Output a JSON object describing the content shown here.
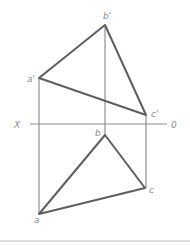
{
  "diagram": {
    "type": "orthographic-projection",
    "axis": {
      "left_label": "X",
      "right_label": "0",
      "y": 124,
      "x1": 30,
      "x2": 167
    },
    "colors": {
      "triangle": "#5e5e5e",
      "projector": "#7a7a7a",
      "axis": "#8a8a8a",
      "label": "#8a8a8a",
      "rule": "#bdbdbd"
    },
    "points": {
      "a_prime": {
        "label": "a'",
        "x": 39,
        "y": 78
      },
      "b_prime": {
        "label": "b'",
        "x": 105,
        "y": 25
      },
      "c_prime": {
        "label": "c'",
        "x": 146,
        "y": 115
      },
      "a": {
        "label": "a",
        "x": 39,
        "y": 214
      },
      "b": {
        "label": "b",
        "x": 105,
        "y": 135
      },
      "c": {
        "label": "c",
        "x": 145,
        "y": 188
      }
    }
  }
}
